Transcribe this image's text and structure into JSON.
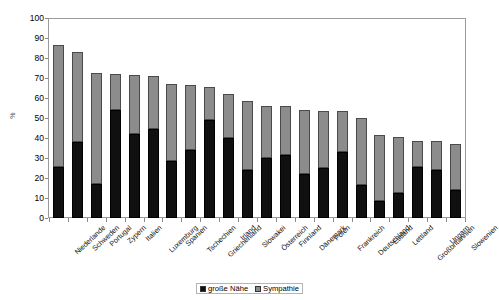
{
  "chart_data": {
    "type": "bar",
    "subtype": "stacked-vertical",
    "title": "",
    "xlabel": "",
    "ylabel": "%",
    "ylim": [
      0,
      100
    ],
    "ytick_step": 10,
    "yticks": [
      100,
      90,
      80,
      70,
      60,
      50,
      40,
      30,
      20,
      10,
      0
    ],
    "grid": false,
    "legend_position": "bottom-center",
    "categories": [
      "Niederlande",
      "Schweden",
      "Portugal",
      "Zypern",
      "Italien",
      "Luxemburg",
      "Spanien",
      "Tschechien",
      "Griechenland",
      "Irland",
      "Slowakei",
      "Österreich",
      "Finnland",
      "Dänemark",
      "Polen",
      "Frankreich",
      "Deutschland",
      "Estland",
      "Lettland",
      "Großbritannien",
      "Ungarn",
      "Slowenien"
    ],
    "series": [
      {
        "name": "große Nähe",
        "color": "#101010",
        "values": [
          25.5,
          38,
          17,
          54.5,
          42,
          44.5,
          28.5,
          34,
          49.5,
          40,
          24,
          30,
          31.5,
          22,
          25,
          33,
          16.5,
          8.5,
          12.5,
          25.5,
          24,
          14
        ]
      },
      {
        "name": "Sympathie",
        "color": "#8c8c8c",
        "values": [
          61.5,
          45.5,
          56,
          18,
          30,
          27,
          39,
          33,
          16.5,
          22.5,
          35,
          26.5,
          25,
          32.5,
          29,
          21,
          34,
          33,
          28,
          13,
          14.5,
          23
        ]
      }
    ],
    "totals": [
      87,
      83.5,
      73,
      72.5,
      72,
      71.5,
      67.5,
      67,
      66,
      62.5,
      59,
      56.5,
      56.5,
      54.5,
      54,
      54,
      50.5,
      41.5,
      40.5,
      38.5,
      38.5,
      37
    ]
  },
  "legend": {
    "items": [
      {
        "label": "große Nähe",
        "swatch": "black-square-icon"
      },
      {
        "label": "Sympathie",
        "swatch": "gray-square-icon"
      }
    ]
  },
  "axis": {
    "y_title": "%"
  }
}
